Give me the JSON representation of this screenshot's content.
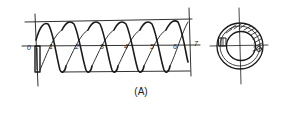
{
  "figure": {
    "caption": "(A)",
    "side_view": {
      "description": "hand-drawn helical coil spring, side view",
      "turn_labels": [
        "0",
        "1",
        "2",
        "3",
        "4",
        "5",
        "6",
        "7"
      ]
    },
    "end_view": {
      "description": "hand-drawn end view of spring: concentric circles with crosshair and partial hatching"
    }
  }
}
